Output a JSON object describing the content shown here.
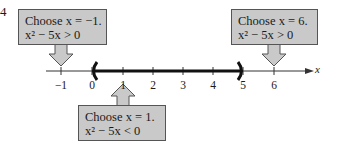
{
  "figure": {
    "label": "4",
    "axis_variable": "x",
    "tick_labels": [
      "−1",
      "0",
      "1",
      "2",
      "3",
      "4",
      "5",
      "6"
    ],
    "interval": {
      "open_left": 0,
      "open_right": 5,
      "notation": "(0, 5)"
    },
    "callouts": [
      {
        "id": "left",
        "line1": "Choose x = −1.",
        "line2": "x² − 5x > 0",
        "points_to": -1
      },
      {
        "id": "middle",
        "line1": "Choose x = 1.",
        "line2": "x² − 5x < 0",
        "points_to": 1
      },
      {
        "id": "right",
        "line1": "Choose x = 6.",
        "line2": "x² − 5x > 0",
        "points_to": 6
      }
    ],
    "colors": {
      "callout_fill": "#c9c9c9",
      "callout_border": "#555555",
      "line": "#1a1a1a"
    }
  }
}
